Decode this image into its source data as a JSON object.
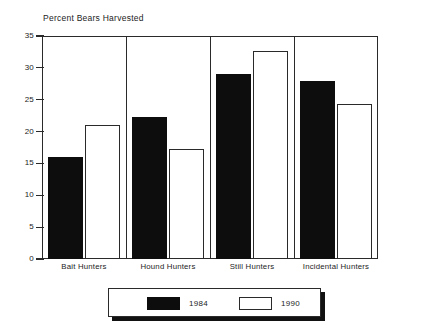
{
  "chart_data": {
    "type": "bar",
    "title": "Percent Bears Harvested",
    "xlabel": "",
    "ylabel": "",
    "categories": [
      "Bait Hunters",
      "Hound Hunters",
      "Still Hunters",
      "Incidental Hunters"
    ],
    "series": [
      {
        "name": "1984",
        "color": "#0d0d0d",
        "values": [
          16.0,
          22.3,
          29.0,
          28.0
        ]
      },
      {
        "name": "1990",
        "color": "#ffffff",
        "values": [
          21.0,
          17.3,
          32.6,
          24.3
        ]
      }
    ],
    "ylim": [
      0,
      35
    ],
    "yticks": [
      0,
      5,
      10,
      15,
      20,
      25,
      30,
      35
    ],
    "ytick_labels": [
      "0",
      "5",
      "10",
      "15",
      "20",
      "25",
      "30",
      "35"
    ],
    "grid": false,
    "legend_position": "bottom-center",
    "legend_entries": [
      "1984",
      "1990"
    ]
  }
}
